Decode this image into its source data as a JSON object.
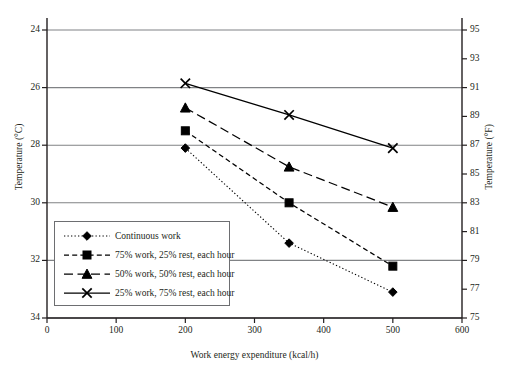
{
  "chart_data": {
    "type": "line",
    "title": "",
    "xlabel": "Work energy expenditure (kcal/h)",
    "ylabel": "Temperature (°C)",
    "y2label": "Temperature (°F)",
    "xlim": [
      0,
      600
    ],
    "ylim": [
      24,
      34
    ],
    "y2lim": [
      75,
      95
    ],
    "xticks": [
      0,
      100,
      200,
      300,
      400,
      500,
      600
    ],
    "yticks": [
      24,
      26,
      28,
      30,
      32,
      34
    ],
    "y2ticks": [
      75,
      77,
      79,
      81,
      83,
      85,
      87,
      89,
      91,
      93,
      95
    ],
    "grid": "horizontal-major",
    "legend_position": "lower-left-inside",
    "x": [
      200,
      350,
      500
    ],
    "series": [
      {
        "name": "Continuous work",
        "marker": "diamond",
        "linestyle": "dotted",
        "values": [
          29.9,
          26.6,
          24.9
        ]
      },
      {
        "name": "75% work, 25% rest, each hour",
        "marker": "square",
        "linestyle": "dashed",
        "values": [
          30.5,
          28.0,
          25.8
        ]
      },
      {
        "name": "50% work, 50% rest, each hour",
        "marker": "triangle",
        "linestyle": "long-dash",
        "values": [
          31.3,
          29.25,
          27.85
        ]
      },
      {
        "name": "25% work, 75% rest, each hour",
        "marker": "cross",
        "linestyle": "solid",
        "values": [
          32.15,
          31.05,
          29.9
        ]
      }
    ]
  },
  "colors": {
    "axis": "#231f20",
    "grid": "#808285",
    "series": "#000000",
    "legend_border": "#6d6e71"
  },
  "legend": {
    "items": [
      "Continuous work",
      "75% work, 25% rest, each hour",
      "50% work, 50% rest, each hour",
      "25% work, 75% rest, each hour"
    ]
  },
  "axes": {
    "left_ticks": [
      "34",
      "32",
      "30",
      "28",
      "26",
      "24"
    ],
    "right_ticks": [
      "95",
      "93",
      "91",
      "89",
      "87",
      "85",
      "83",
      "81",
      "79",
      "77",
      "75"
    ],
    "bottom_ticks": [
      "0",
      "100",
      "200",
      "300",
      "400",
      "500",
      "600"
    ],
    "left_title": "Temperature (°C)",
    "right_title": "Temperature (°F)",
    "bottom_title": "Work energy expenditure (kcal/h)"
  }
}
